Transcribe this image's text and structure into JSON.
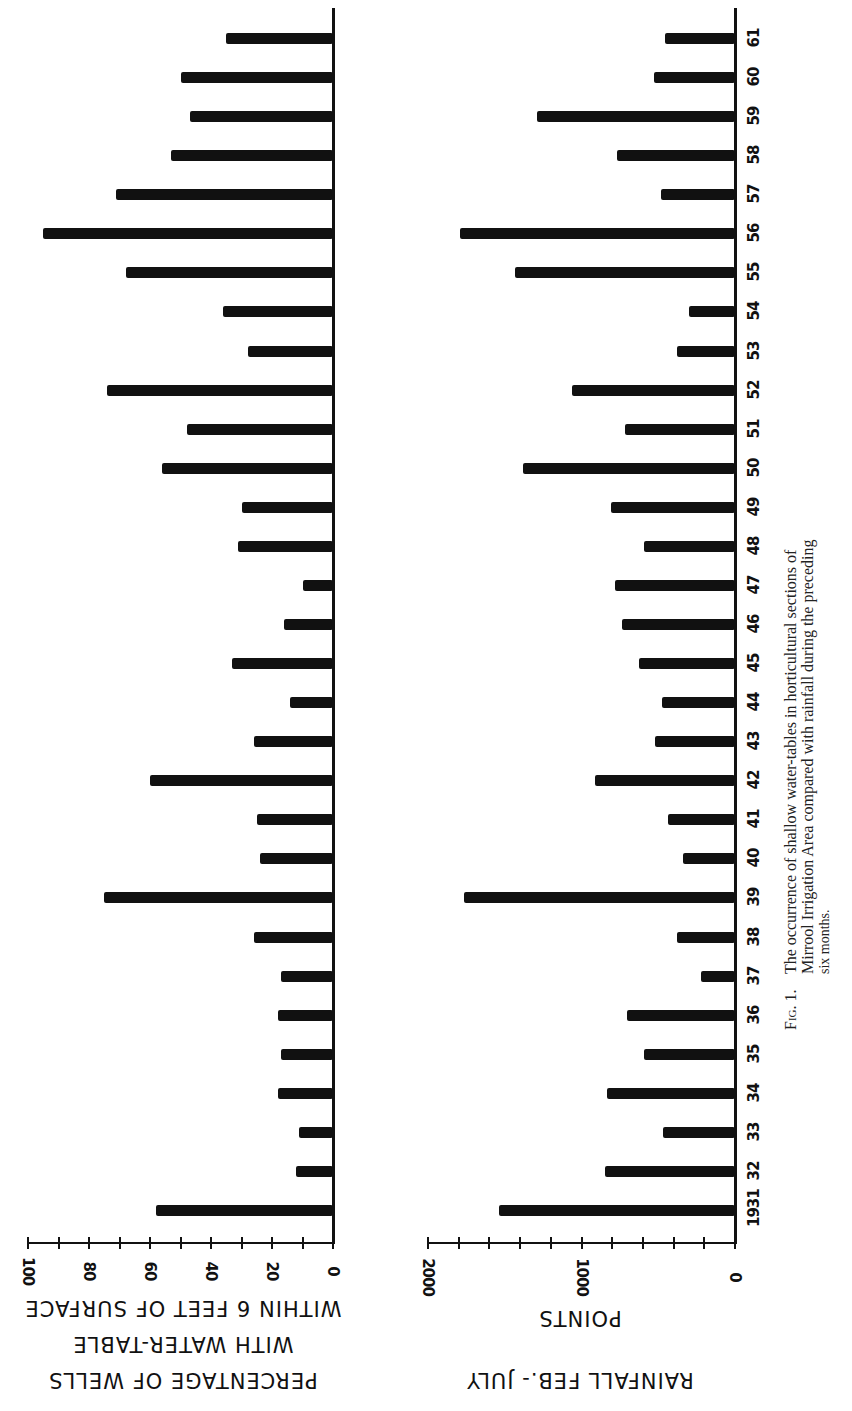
{
  "figure": {
    "caption_label": "Fig. 1.",
    "caption_lines": [
      "The occurrence of shallow water-tables in horticultural sections of",
      "Mirrool Irrigation Area compared with rainfall during the preceding",
      "six months."
    ]
  },
  "top_chart": {
    "axis_title_lines": [
      "PERCENTAGE OF WELLS",
      "WITH WATER-TABLE",
      "WITHIN 6 FEET OF SURFACE"
    ],
    "tick_labels": [
      "0",
      "20",
      "40",
      "60",
      "80",
      "100"
    ]
  },
  "bottom_chart": {
    "axis_title_lines": [
      "POINTS",
      "RAINFALL FEB.- JULY"
    ],
    "tick_labels": [
      "0",
      "1000",
      "2000"
    ]
  },
  "year_labels": [
    "1931",
    "32",
    "33",
    "34",
    "35",
    "36",
    "37",
    "38",
    "39",
    "40",
    "41",
    "42",
    "43",
    "44",
    "45",
    "46",
    "47",
    "48",
    "49",
    "50",
    "51",
    "52",
    "53",
    "54",
    "55",
    "56",
    "57",
    "58",
    "59",
    "60",
    "61"
  ],
  "chart_data": [
    {
      "type": "bar",
      "orientation": "horizontal",
      "title": "Percentage of wells with water-table within 6 feet of surface",
      "xlabel": "PERCENTAGE OF WELLS WITH WATER-TABLE WITHIN 6 FEET OF SURFACE",
      "ylabel": "Year",
      "xlim": [
        0,
        100
      ],
      "x_ticks": [
        0,
        10,
        20,
        30,
        40,
        50,
        60,
        70,
        80,
        90,
        100
      ],
      "x_tick_labels": [
        "0",
        "20",
        "40",
        "60",
        "80",
        "100"
      ],
      "grid": false,
      "categories": [
        "1931",
        "1932",
        "1933",
        "1934",
        "1935",
        "1936",
        "1937",
        "1938",
        "1939",
        "1940",
        "1941",
        "1942",
        "1943",
        "1944",
        "1945",
        "1946",
        "1947",
        "1948",
        "1949",
        "1950",
        "1951",
        "1952",
        "1953",
        "1954",
        "1955",
        "1956",
        "1957",
        "1958",
        "1959",
        "1960",
        "1961"
      ],
      "values": [
        58,
        12,
        11,
        18,
        17,
        18,
        17,
        26,
        75,
        24,
        25,
        60,
        26,
        14,
        33,
        16,
        10,
        31,
        30,
        56,
        48,
        74,
        28,
        36,
        68,
        95,
        71,
        53,
        47,
        50,
        35
      ]
    },
    {
      "type": "bar",
      "orientation": "horizontal",
      "title": "Rainfall Feb.-July (points)",
      "xlabel": "RAINFALL FEB.- JULY POINTS",
      "ylabel": "Year",
      "xlim": [
        0,
        2000
      ],
      "x_ticks": [
        0,
        200,
        400,
        600,
        800,
        1000,
        1200,
        1400,
        1600,
        1800,
        2000
      ],
      "x_tick_labels": [
        "0",
        "1000",
        "2000"
      ],
      "grid": false,
      "categories": [
        "1931",
        "1932",
        "1933",
        "1934",
        "1935",
        "1936",
        "1937",
        "1938",
        "1939",
        "1940",
        "1941",
        "1942",
        "1943",
        "1944",
        "1945",
        "1946",
        "1947",
        "1948",
        "1949",
        "1950",
        "1951",
        "1952",
        "1953",
        "1954",
        "1955",
        "1956",
        "1957",
        "1958",
        "1959",
        "1960",
        "1961"
      ],
      "values": [
        1540,
        845,
        470,
        835,
        590,
        705,
        220,
        380,
        1765,
        340,
        435,
        910,
        520,
        475,
        625,
        735,
        780,
        590,
        810,
        1380,
        715,
        1060,
        380,
        300,
        1430,
        1790,
        480,
        770,
        1290,
        530,
        455
      ]
    }
  ],
  "colors": {
    "bar": "#111111",
    "background": "#ffffff",
    "text": "#111111"
  }
}
